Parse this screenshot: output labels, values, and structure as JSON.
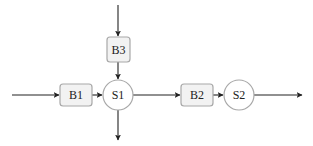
{
  "diagram": {
    "type": "block-diagram",
    "colors": {
      "block_fill": "#f2f2f2",
      "block_stroke": "#a8a8a8",
      "node_fill": "#ffffff",
      "edge": "#222222",
      "text": "#222222"
    },
    "blocks": [
      {
        "id": "B1",
        "label": "B1"
      },
      {
        "id": "B2",
        "label": "B2"
      },
      {
        "id": "B3",
        "label": "B3"
      }
    ],
    "nodes": [
      {
        "id": "S1",
        "label": "S1"
      },
      {
        "id": "S2",
        "label": "S2"
      }
    ],
    "edges": [
      {
        "from": "input-left",
        "to": "B1"
      },
      {
        "from": "B1",
        "to": "S1"
      },
      {
        "from": "input-top",
        "to": "B3"
      },
      {
        "from": "B3",
        "to": "S1"
      },
      {
        "from": "S1",
        "to": "B2"
      },
      {
        "from": "S1",
        "to": "output-bottom"
      },
      {
        "from": "B2",
        "to": "S2"
      },
      {
        "from": "S2",
        "to": "output-right"
      }
    ]
  }
}
